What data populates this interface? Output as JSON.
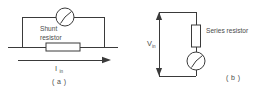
{
  "figure": {
    "title": "",
    "panels": [
      {
        "id": "a",
        "caption": "( a )",
        "type": "shunt-ammeter-circuit",
        "component_label": "Shunt\nresistor",
        "component_label_line1": "Shunt",
        "component_label_line2": "resistor",
        "current_symbol": "I",
        "current_subscript": "in",
        "meter": "analog-meter"
      },
      {
        "id": "b",
        "caption": "( b )",
        "type": "series-voltmeter-circuit",
        "component_label": "Series resistor",
        "voltage_symbol": "V",
        "voltage_subscript": "in",
        "meter": "analog-meter"
      }
    ],
    "colors": {
      "line": "#3a3a3a",
      "text": "#4a4a4a",
      "background": "#ffffff"
    }
  }
}
